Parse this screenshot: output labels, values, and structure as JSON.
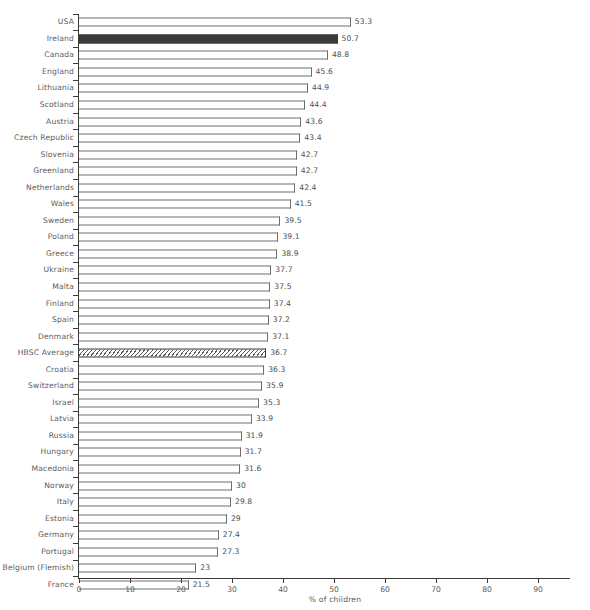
{
  "chart_data": {
    "type": "bar",
    "orientation": "horizontal",
    "title": "",
    "xlabel": "% of children",
    "ylabel": "",
    "xlim": [
      0,
      96.5
    ],
    "grid": false,
    "legend": false,
    "xticks": [
      0,
      10,
      20,
      30,
      40,
      50,
      60,
      70,
      80,
      90
    ],
    "xtick_labels": [
      "0",
      "10",
      "20",
      "30",
      "40",
      "50",
      "60",
      "70",
      "80",
      "90"
    ],
    "categories": [
      "USA",
      "Ireland",
      "Canada",
      "England",
      "Lithuania",
      "Scotland",
      "Austria",
      "Czech Republic",
      "Slovenia",
      "Greenland",
      "Netherlands",
      "Wales",
      "Sweden",
      "Poland",
      "Greece",
      "Ukraine",
      "Malta",
      "Finland",
      "Spain",
      "Denmark",
      "HBSC Average",
      "Croatia",
      "Switzerland",
      "Israel",
      "Latvia",
      "Russia",
      "Hungary",
      "Macedonia",
      "Norway",
      "Italy",
      "Estonia",
      "Germany",
      "Portugal",
      "Belgium (Flemish)",
      "France"
    ],
    "values": [
      53.3,
      50.7,
      48.8,
      45.6,
      44.9,
      44.4,
      43.6,
      43.4,
      42.7,
      42.7,
      42.4,
      41.5,
      39.5,
      39.1,
      38.9,
      37.7,
      37.5,
      37.4,
      37.2,
      37.1,
      36.7,
      36.3,
      35.9,
      35.3,
      33.9,
      31.9,
      31.7,
      31.6,
      30,
      29.8,
      29,
      27.4,
      27.3,
      23,
      21.5
    ],
    "value_labels": [
      "53.3",
      "50.7",
      "48.8",
      "45.6",
      "44.9",
      "44.4",
      "43.6",
      "43.4",
      "42.7",
      "42.7",
      "42.4",
      "41.5",
      "39.5",
      "39.1",
      "38.9",
      "37.7",
      "37.5",
      "37.4",
      "37.2",
      "37.1",
      "36.7",
      "36.3",
      "35.9",
      "35.3",
      "33.9",
      "31.9",
      "31.7",
      "31.6",
      "30",
      "29.8",
      "29",
      "27.4",
      "27.3",
      "23",
      "21.5"
    ],
    "styles": [
      "plain",
      "highlight",
      "plain",
      "plain",
      "plain",
      "plain",
      "plain",
      "plain",
      "plain",
      "plain",
      "plain",
      "plain",
      "plain",
      "plain",
      "plain",
      "plain",
      "plain",
      "plain",
      "plain",
      "plain",
      "hatched",
      "plain",
      "plain",
      "plain",
      "plain",
      "plain",
      "plain",
      "plain",
      "plain",
      "plain",
      "plain",
      "plain",
      "plain",
      "plain",
      "plain"
    ],
    "colors": {
      "bar_fill": "#ffffff",
      "bar_edge": "#6e6e6e",
      "highlight_fill": "#3b3b3b",
      "hatch_line": "#5a5a5a",
      "axis": "#3b3b3b",
      "text": "#5b5b5b",
      "background": "#ffffff"
    }
  }
}
